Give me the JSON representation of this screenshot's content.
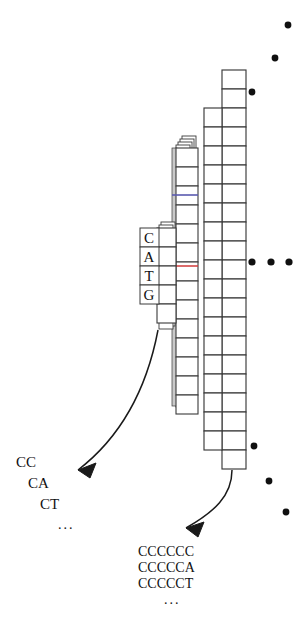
{
  "figure": {
    "title": "",
    "background": "#ffffff",
    "stroke_color": "#3a3a3a",
    "accent_red": "#d03a3a",
    "accent_blue": "#5a5ab0",
    "dot_color": "#101010"
  },
  "nucleotide_column": {
    "label": "nucleotide-letters",
    "letters": [
      "C",
      "A",
      "T",
      "G"
    ]
  },
  "left_sequences": {
    "label": "short-prefix-list",
    "rows": [
      "CC",
      "CA",
      "CT",
      "..."
    ]
  },
  "right_sequences": {
    "label": "long-prefix-list",
    "rows": [
      "CCCCCC",
      "CCCCCA",
      "CCCCCT",
      "..."
    ]
  },
  "ellipsis_groups": [
    {
      "name": "top-right-diagonal-dots",
      "count": 3
    },
    {
      "name": "middle-right-horizontal-dots",
      "count": 3
    },
    {
      "name": "bottom-right-diagonal-dots",
      "count": 3
    }
  ],
  "arrows": [
    {
      "name": "arrow-to-short-list"
    },
    {
      "name": "arrow-to-long-list"
    }
  ],
  "columns": [
    {
      "name": "tall-column-right-outer",
      "cells": 23
    },
    {
      "name": "tall-column-right-inner",
      "cells": 20
    },
    {
      "name": "stacked-column-front",
      "cells": 19
    },
    {
      "name": "stacked-column-layers",
      "cells": 4
    },
    {
      "name": "short-column-left",
      "cells": 6
    }
  ]
}
